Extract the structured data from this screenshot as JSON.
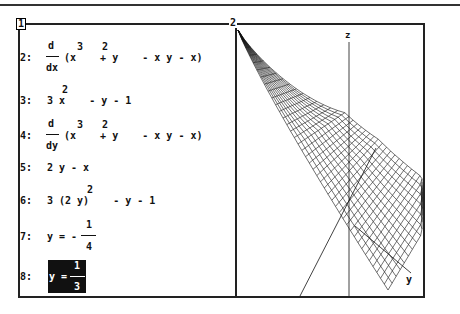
{
  "windows": [
    {
      "label": "1",
      "active": true
    },
    {
      "label": "2",
      "active": false
    }
  ],
  "algebra": {
    "entries": [
      {
        "num": "2:",
        "op": "d",
        "var": "dx",
        "body": "(x    + y    - x y - x)",
        "exps": [
          "3",
          "2"
        ]
      },
      {
        "num": "3:",
        "body": "3 x    - y - 1",
        "exps": [
          "2"
        ]
      },
      {
        "num": "4:",
        "op": "d",
        "var": "dy",
        "body": "(x    + y    - x y - x)",
        "exps": [
          "3",
          "2"
        ]
      },
      {
        "num": "5:",
        "body": "2 y - x"
      },
      {
        "num": "6:",
        "body": "3 (2 y)    - y - 1",
        "exps": [
          "2"
        ]
      },
      {
        "num": "7:",
        "lhs": "y = -",
        "numer": "1",
        "denom": "4"
      },
      {
        "num": "8:",
        "lhs": "y =",
        "numer": "1",
        "denom": "3",
        "highlighted": true
      }
    ]
  },
  "plot3d": {
    "axis_labels": {
      "z": "z",
      "y": "y"
    },
    "surface": "x^3 + y^2 - x y - x"
  }
}
